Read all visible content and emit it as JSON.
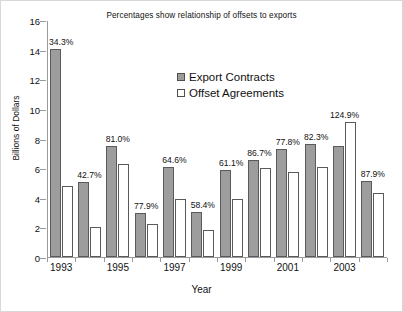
{
  "chart_data": {
    "type": "bar",
    "title": "Percentages show relationship of offsets to exports",
    "xlabel": "Year",
    "ylabel": "Billions of Dollars",
    "ylim": [
      0,
      16
    ],
    "yticks": [
      0,
      2,
      4,
      6,
      8,
      10,
      12,
      14,
      16
    ],
    "grid": false,
    "legend_position": "upper-center",
    "categories": [
      "1993",
      "1994",
      "1995",
      "1996",
      "1997",
      "1998",
      "1999",
      "2000",
      "2001",
      "2002",
      "2003",
      "2004"
    ],
    "tick_labels": [
      "1993",
      "",
      "1995",
      "",
      "1997",
      "",
      "1999",
      "",
      "2001",
      "",
      "2003",
      ""
    ],
    "series": [
      {
        "name": "Export Contracts",
        "color": "#9d9d9d",
        "values": [
          14.05,
          5.05,
          7.5,
          3.0,
          6.05,
          3.05,
          5.9,
          6.55,
          7.3,
          7.6,
          7.5,
          5.15
        ]
      },
      {
        "name": "Offset Agreements",
        "color": "#ffffff",
        "values": [
          4.82,
          2.0,
          6.25,
          2.25,
          3.95,
          1.8,
          3.9,
          6.0,
          5.75,
          6.1,
          9.1,
          4.35
        ]
      }
    ],
    "annotations": [
      "34.3%",
      "42.7%",
      "81.0%",
      "77.9%",
      "64.6%",
      "58.4%",
      "61.1%",
      "86.7%",
      "77.8%",
      "82.3%",
      "124.9%",
      "87.9%"
    ]
  }
}
